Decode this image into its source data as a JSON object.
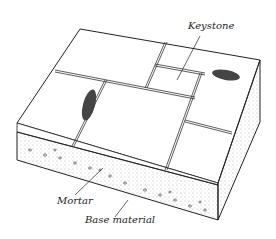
{
  "diagram": {
    "type": "paving cross-section illustration",
    "labels": {
      "keystone": "Keystone",
      "mortar": "Mortar",
      "base_material": "Base material"
    },
    "colors": {
      "line": "#222222",
      "background": "#ffffff",
      "mortar_stipple": "#555555"
    }
  }
}
